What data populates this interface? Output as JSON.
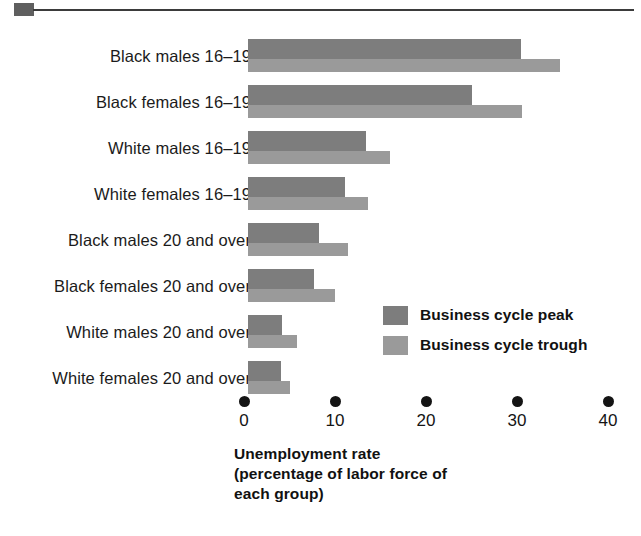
{
  "decoration": {
    "corner_marker": "square-marker",
    "rule": "horizontal-rule"
  },
  "legend": {
    "position": "inside-bottom-right",
    "items": [
      {
        "label": "Business cycle peak",
        "color": "#7d7d7d"
      },
      {
        "label": "Business cycle trough",
        "color": "#9a9a9a"
      }
    ]
  },
  "axis": {
    "title_line1": "Unemployment rate",
    "title_line2": "(percentage of labor force of",
    "title_line3": "each group)",
    "ticks": [
      "0",
      "10",
      "20",
      "30",
      "40"
    ]
  },
  "chart_data": {
    "type": "bar",
    "orientation": "horizontal",
    "title": "",
    "xlabel": "Unemployment rate (percentage of labor force of each group)",
    "ylabel": "",
    "xlim": [
      0,
      40
    ],
    "xticks": [
      0,
      10,
      20,
      30,
      40
    ],
    "grid": false,
    "legend_position": "inside-bottom-right",
    "categories": [
      "Black males 16–19",
      "Black females 16–19",
      "White males 16–19",
      "White females 16–19",
      "Black males 20 and over",
      "Black females 20 and over",
      "White males 20 and over",
      "White females 20 and over"
    ],
    "series": [
      {
        "name": "Business cycle peak",
        "color": "#7d7d7d",
        "values": [
          30.0,
          24.6,
          13.0,
          10.7,
          7.8,
          7.2,
          3.7,
          3.6
        ]
      },
      {
        "name": "Business cycle trough",
        "color": "#9a9a9a",
        "values": [
          34.3,
          30.1,
          15.6,
          13.2,
          11.0,
          9.6,
          5.4,
          4.6
        ]
      }
    ]
  }
}
